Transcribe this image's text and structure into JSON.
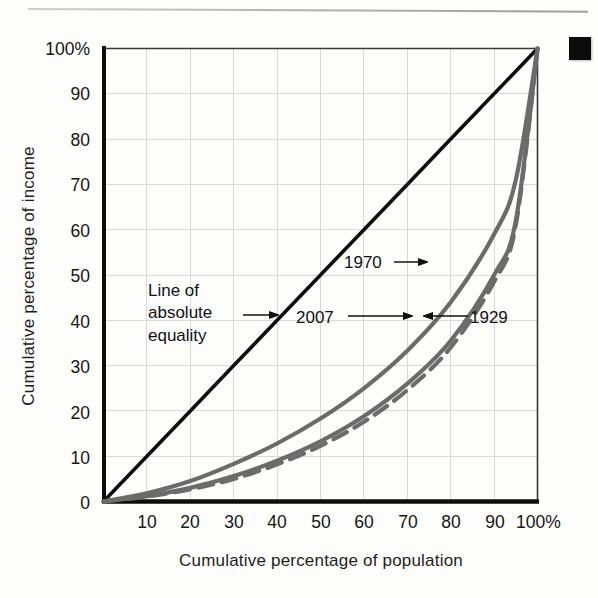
{
  "figure": {
    "corner_marker": "black-square",
    "axis_color": "#111111",
    "grid_color": "#d8d8d8",
    "curve_color": "#6b6b6b",
    "equality_line_color": "#0d0d0d"
  },
  "chart_data": {
    "type": "line",
    "title": "",
    "subtitle": "",
    "xlabel": "Cumulative percentage of population",
    "ylabel": "Cumulative percentage of income",
    "xlim": [
      0,
      100
    ],
    "ylim": [
      0,
      100
    ],
    "grid": true,
    "legend_position": "inline-annotations",
    "xticks": [
      "10",
      "20",
      "30",
      "40",
      "50",
      "60",
      "70",
      "80",
      "90",
      "100%"
    ],
    "xtick_values": [
      10,
      20,
      30,
      40,
      50,
      60,
      70,
      80,
      90,
      100
    ],
    "yticks": [
      "0",
      "10",
      "20",
      "30",
      "40",
      "50",
      "60",
      "70",
      "80",
      "90",
      "100%"
    ],
    "ytick_values": [
      0,
      10,
      20,
      30,
      40,
      50,
      60,
      70,
      80,
      90,
      100
    ],
    "x": [
      0,
      10,
      20,
      30,
      40,
      50,
      60,
      70,
      80,
      90,
      95,
      100
    ],
    "series": [
      {
        "name": "Line of absolute equality",
        "style": "solid-black",
        "values": [
          0,
          10,
          20,
          30,
          40,
          50,
          60,
          70,
          80,
          90,
          95,
          100
        ]
      },
      {
        "name": "1970",
        "style": "solid-gray",
        "values": [
          0,
          1.8,
          4.5,
          8.3,
          12.8,
          18.3,
          25.0,
          33.3,
          44.0,
          59.0,
          71.0,
          100
        ]
      },
      {
        "name": "2007",
        "style": "solid-gray",
        "values": [
          0,
          1.2,
          3.0,
          5.6,
          9.0,
          13.3,
          18.8,
          26.0,
          35.5,
          50.0,
          62.0,
          100
        ]
      },
      {
        "name": "1929",
        "style": "dashed-gray",
        "values": [
          0,
          1.1,
          2.7,
          5.0,
          8.2,
          12.3,
          17.6,
          24.6,
          34.0,
          48.5,
          61.0,
          100
        ]
      }
    ],
    "annotations": [
      {
        "name": "equality-annotation",
        "lines": [
          "Line of",
          "absolute",
          "equality"
        ],
        "arrow": "right",
        "target_series": "Line of absolute equality"
      },
      {
        "name": "1970-annotation",
        "lines": [
          "1970"
        ],
        "arrow": "right",
        "target_series": "1970"
      },
      {
        "name": "2007-annotation",
        "lines": [
          "2007"
        ],
        "arrow": "right",
        "target_series": "2007"
      },
      {
        "name": "1929-annotation",
        "lines": [
          "1929"
        ],
        "arrow": "left",
        "target_series": "1929"
      }
    ]
  },
  "labels": {
    "xlabel": "Cumulative percentage of population",
    "ylabel": "Cumulative percentage of income",
    "equality_line1": "Line of",
    "equality_line2": "absolute",
    "equality_line3": "equality",
    "y1970": "1970",
    "y2007": "2007",
    "y1929": "1929",
    "ytick_0": "0",
    "ytick_10": "10",
    "ytick_20": "20",
    "ytick_30": "30",
    "ytick_40": "40",
    "ytick_50": "50",
    "ytick_60": "60",
    "ytick_70": "70",
    "ytick_80": "80",
    "ytick_90": "90",
    "ytick_100": "100%",
    "xtick_10": "10",
    "xtick_20": "20",
    "xtick_30": "30",
    "xtick_40": "40",
    "xtick_50": "50",
    "xtick_60": "60",
    "xtick_70": "70",
    "xtick_80": "80",
    "xtick_90": "90",
    "xtick_100": "100%"
  }
}
